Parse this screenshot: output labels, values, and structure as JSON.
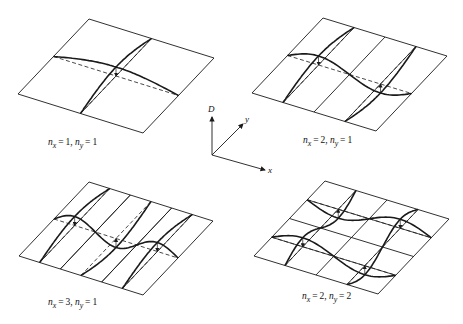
{
  "figure": {
    "type": "plate vibration mode shapes diagram",
    "axes": {
      "origin": [
        212,
        155
      ],
      "labels": {
        "vertical": "D",
        "depth": "y",
        "horizontal": "x"
      },
      "vertical_end": [
        212,
        117
      ],
      "depth_end": [
        243,
        124
      ],
      "horizontal_end": [
        265,
        170
      ]
    },
    "panels": [
      {
        "id": "mode-1-1",
        "label": {
          "nx_symbol": "n",
          "nx_sub": "x",
          "nx_value": "1",
          "ny_symbol": "n",
          "ny_sub": "y",
          "ny_value": "1",
          "text": "n_x = 1, n_y = 1"
        },
        "nx": 1,
        "ny": 1,
        "corners": {
          "left": [
            18,
            94
          ],
          "bottom": [
            143,
            133
          ],
          "top": [
            89,
            19
          ]
        },
        "label_pos": [
          48,
          137
        ]
      },
      {
        "id": "mode-2-1",
        "label": {
          "nx_symbol": "n",
          "nx_sub": "x",
          "nx_value": "2",
          "ny_symbol": "n",
          "ny_sub": "y",
          "ny_value": "1",
          "text": "n_x = 2, n_y = 1"
        },
        "nx": 2,
        "ny": 1,
        "corners": {
          "left": [
            252,
            93
          ],
          "bottom": [
            376,
            131
          ],
          "top": [
            323,
            18
          ]
        },
        "label_pos": [
          303,
          135
        ]
      },
      {
        "id": "mode-3-1",
        "label": {
          "nx_symbol": "n",
          "nx_sub": "x",
          "nx_value": "3",
          "ny_symbol": "n",
          "ny_sub": "y",
          "ny_value": "1",
          "text": "n_x = 3, n_y = 1"
        },
        "nx": 3,
        "ny": 1,
        "corners": {
          "left": [
            19,
            256
          ],
          "bottom": [
            143,
            295
          ],
          "top": [
            89,
            182
          ]
        },
        "label_pos": [
          48,
          297
        ]
      },
      {
        "id": "mode-2-2",
        "label": {
          "nx_symbol": "n",
          "nx_sub": "x",
          "nx_value": "2",
          "ny_symbol": "n",
          "ny_sub": "y",
          "ny_value": "2",
          "text": "n_x = 2, n_y = 2"
        },
        "nx": 2,
        "ny": 2,
        "corners": {
          "left": [
            254,
            256
          ],
          "bottom": [
            378,
            294
          ],
          "top": [
            325,
            181
          ]
        },
        "label_pos": [
          302,
          291
        ]
      }
    ],
    "style": {
      "line_color": "#1a1a1a",
      "plate_stroke": 0.9,
      "mode_stroke": 1.6,
      "amplitude_px": 9
    }
  }
}
